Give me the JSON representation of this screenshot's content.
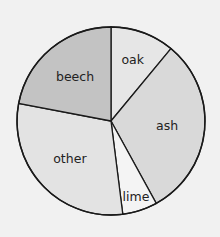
{
  "chart_data": {
    "type": "pie",
    "title": "",
    "start_angle_deg": 0,
    "direction": "clockwise",
    "categories": [
      "oak",
      "ash",
      "lime",
      "other",
      "beech"
    ],
    "values": [
      11,
      31,
      6,
      30,
      22
    ],
    "unit": "percent (estimated from slice angles)",
    "colors": [
      "#e6e6e6",
      "#d9d9d9",
      "#f4f4f4",
      "#e3e3e3",
      "#c3c3c3"
    ],
    "legend": "none (labels inside slices)"
  },
  "labels": {
    "oak": "oak",
    "ash": "ash",
    "lime": "lime",
    "other": "other",
    "beech": "beech"
  }
}
